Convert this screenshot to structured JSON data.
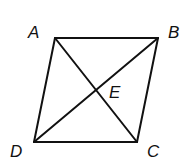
{
  "diagram": {
    "type": "parallelogram-with-diagonals",
    "stroke_color": "#111111",
    "vertices": {
      "A": {
        "label": "A",
        "x": 55,
        "y": 38
      },
      "B": {
        "label": "B",
        "x": 158,
        "y": 38
      },
      "C": {
        "label": "C",
        "x": 137,
        "y": 142
      },
      "D": {
        "label": "D",
        "x": 34,
        "y": 142
      }
    },
    "intersection": {
      "label": "E",
      "x": 97,
      "y": 90
    },
    "labels": {
      "A": "A",
      "B": "B",
      "C": "C",
      "D": "D",
      "E": "E"
    }
  }
}
